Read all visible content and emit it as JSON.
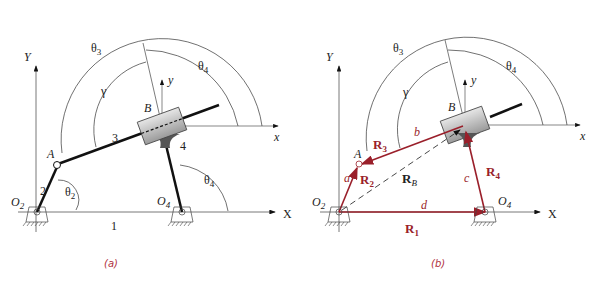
{
  "figure": {
    "panels": [
      {
        "id": "a",
        "caption": "(a)",
        "axes": {
          "Y": "Y",
          "X": "X",
          "local_x": "x",
          "local_y": "y"
        },
        "points": {
          "O2": "O",
          "O2_sub": "2",
          "O4": "O",
          "O4_sub": "4",
          "A": "A",
          "B": "B"
        },
        "links": {
          "l1": "1",
          "l2": "2",
          "l3": "3",
          "l4": "4"
        },
        "angles": {
          "theta3": "θ",
          "theta3_sub": "3",
          "theta4_top": "θ",
          "theta4_top_sub": "4",
          "gamma": "γ",
          "theta2": "θ",
          "theta2_sub": "2",
          "theta4_bottom": "θ",
          "theta4_bottom_sub": "4"
        }
      },
      {
        "id": "b",
        "caption": "(b)",
        "axes": {
          "Y": "Y",
          "X": "X",
          "local_x": "x",
          "local_y": "y"
        },
        "points": {
          "O2": "O",
          "O2_sub": "2",
          "O4": "O",
          "O4_sub": "4",
          "A": "A",
          "B": "B"
        },
        "lengths": {
          "a": "a",
          "b": "b",
          "c": "c",
          "d": "d"
        },
        "vectors": {
          "R1": "R",
          "R1_sub": "1",
          "R2": "R",
          "R2_sub": "2",
          "R3": "R",
          "R3_sub": "3",
          "R4": "R",
          "R4_sub": "4",
          "RB": "R",
          "RB_sub": "B"
        },
        "angles": {
          "theta3": "θ",
          "theta3_sub": "3",
          "theta4": "θ",
          "theta4_sub": "4",
          "gamma": "γ"
        }
      }
    ],
    "colors": {
      "vector_red": "#9a1f2a",
      "link_black": "#111111",
      "caption": "#b03040",
      "axis_gray": "#555555"
    }
  }
}
